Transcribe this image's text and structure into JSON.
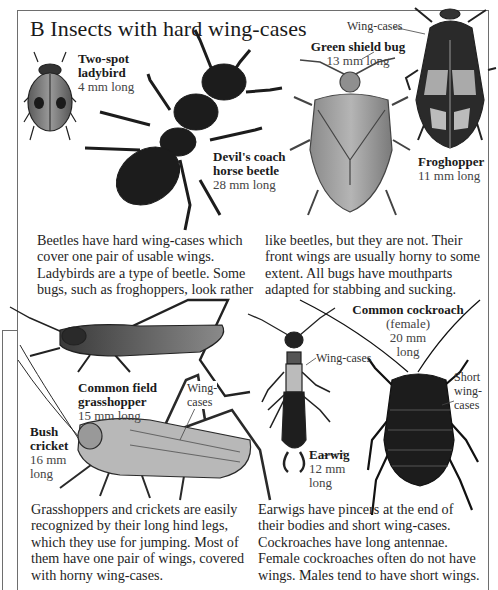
{
  "section": {
    "letter": "B",
    "title": "B  Insects with hard wing-cases"
  },
  "insects": [
    {
      "id": "two-spot-ladybird",
      "name_lines": [
        "Two-spot",
        "ladybird"
      ],
      "size": "4 mm long"
    },
    {
      "id": "devils-coach-horse-beetle",
      "name_lines": [
        "Devil's coach",
        "horse beetle"
      ],
      "size": "28 mm long"
    },
    {
      "id": "green-shield-bug",
      "name_lines": [
        "Green shield bug"
      ],
      "size": "13 mm long"
    },
    {
      "id": "froghopper",
      "name_lines": [
        "Froghopper"
      ],
      "size": "11 mm long"
    },
    {
      "id": "common-field-grasshopper",
      "name_lines": [
        "Common field",
        "grasshopper"
      ],
      "size": "15 mm long"
    },
    {
      "id": "bush-cricket",
      "name_lines": [
        "Bush",
        "cricket"
      ],
      "size_lines": [
        "16 mm",
        "long"
      ]
    },
    {
      "id": "earwig",
      "name_lines": [
        "Earwig"
      ],
      "size_lines": [
        "12 mm",
        "long"
      ]
    },
    {
      "id": "common-cockroach",
      "name_lines": [
        "Common cockroach"
      ],
      "sub": "(female)",
      "size_lines": [
        "20 mm",
        "long"
      ]
    }
  ],
  "callouts": {
    "froghopper_wing_cases": "Wing-cases",
    "grasshopper_wing_cases": [
      "Wing-",
      "cases"
    ],
    "earwig_wing_cases": "Wing-cases",
    "cockroach_short_wing_cases": [
      "Short",
      "wing-",
      "cases"
    ]
  },
  "paragraphs": {
    "beetles_col1": [
      "Beetles have hard wing-cases which",
      "cover one pair of usable wings.",
      "Ladybirds are a type of beetle. Some",
      "bugs, such as froghoppers, look rather"
    ],
    "beetles_col2": [
      "like beetles, but they are not. Their",
      "front wings are usually horny to some",
      "extent. All bugs have mouthparts",
      "adapted for stabbing and sucking."
    ],
    "grasshoppers": [
      "Grasshoppers and crickets are easily",
      "recognized by their long hind legs,",
      "which they use for jumping. Most of",
      "them have one pair of wings, covered",
      "with horny wing-cases."
    ],
    "earwigs": [
      "Earwigs have pincers at the end of",
      "their bodies and short wing-cases.",
      "Cockroaches have long antennae.",
      "Female cockroaches often do not have",
      "wings. Males tend to have short wings."
    ]
  },
  "colors": {
    "frame": "#6e6e6e",
    "text": "#1e1e1e",
    "ink_dark": "#1a1a1a"
  }
}
